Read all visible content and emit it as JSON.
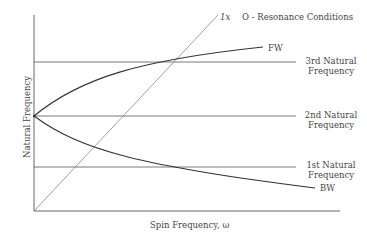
{
  "title": "O - Resonance Conditions",
  "axes": {
    "y_label": "Natural Frequency",
    "x_label": "Spin Frequency, ω"
  },
  "lines": {
    "excitation": "1x",
    "forward_whirl": "FW",
    "backward_whirl": "BW"
  },
  "natural_frequencies": [
    {
      "line1": "3rd Natural",
      "line2": "Frequency"
    },
    {
      "line1": "2nd Natural",
      "line2": "Frequency"
    },
    {
      "line1": "1st Natural",
      "line2": "Frequency"
    }
  ],
  "colors": {
    "line": "#444444",
    "axis": "#555555",
    "light": "#777777"
  }
}
